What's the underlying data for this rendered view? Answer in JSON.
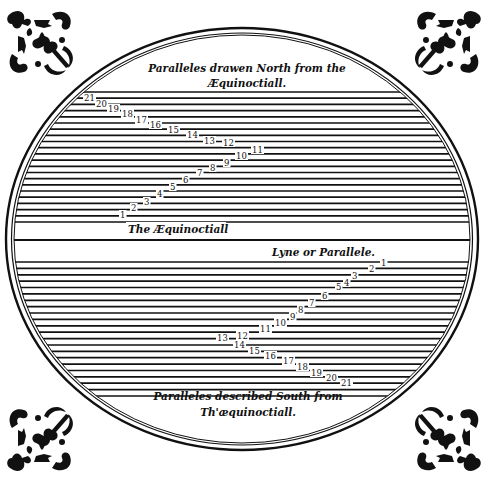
{
  "diagram": {
    "title_north": [
      "Paralleles drawen North from the",
      "Æquinoctiall."
    ],
    "title_south": [
      "Paralleles described South from",
      "Th'æquinoctiall."
    ],
    "equator_label": "The Æquinoctiall",
    "parallel_label": "Lyne or Parallele.",
    "ink_color": "#111111",
    "paper_color": "#ffffff",
    "ellipse": {
      "cx": 242,
      "cy": 239,
      "rx": 236,
      "ry": 211,
      "inner_offset": 5
    },
    "equator_y": 240,
    "north_parallels": {
      "top": 92,
      "bottom": 222,
      "count": 22
    },
    "south_parallels": {
      "top": 262,
      "bottom": 396,
      "count": 22
    },
    "north_numbers": [
      {
        "n": "1",
        "x": 120,
        "y": 218
      },
      {
        "n": "2",
        "x": 131,
        "y": 211
      },
      {
        "n": "3",
        "x": 144,
        "y": 205
      },
      {
        "n": "4",
        "x": 157,
        "y": 197
      },
      {
        "n": "5",
        "x": 170,
        "y": 190
      },
      {
        "n": "6",
        "x": 183,
        "y": 183
      },
      {
        "n": "7",
        "x": 197,
        "y": 176
      },
      {
        "n": "8",
        "x": 210,
        "y": 171
      },
      {
        "n": "9",
        "x": 224,
        "y": 166
      },
      {
        "n": "10",
        "x": 236,
        "y": 159
      },
      {
        "n": "11",
        "x": 252,
        "y": 153
      },
      {
        "n": "12",
        "x": 223,
        "y": 146
      },
      {
        "n": "13",
        "x": 204,
        "y": 144
      },
      {
        "n": "14",
        "x": 187,
        "y": 138
      },
      {
        "n": "15",
        "x": 168,
        "y": 133
      },
      {
        "n": "16",
        "x": 150,
        "y": 128
      },
      {
        "n": "17",
        "x": 136,
        "y": 123
      },
      {
        "n": "18",
        "x": 122,
        "y": 117
      },
      {
        "n": "19",
        "x": 108,
        "y": 112
      },
      {
        "n": "20",
        "x": 96,
        "y": 107
      },
      {
        "n": "21",
        "x": 84,
        "y": 101
      }
    ],
    "south_numbers": [
      {
        "n": "1",
        "x": 381,
        "y": 266
      },
      {
        "n": "2",
        "x": 369,
        "y": 272
      },
      {
        "n": "3",
        "x": 352,
        "y": 279
      },
      {
        "n": "4",
        "x": 344,
        "y": 286
      },
      {
        "n": "5",
        "x": 336,
        "y": 290
      },
      {
        "n": "6",
        "x": 322,
        "y": 299
      },
      {
        "n": "7",
        "x": 309,
        "y": 306
      },
      {
        "n": "8",
        "x": 298,
        "y": 313
      },
      {
        "n": "9",
        "x": 290,
        "y": 320
      },
      {
        "n": "10",
        "x": 275,
        "y": 326
      },
      {
        "n": "11",
        "x": 260,
        "y": 332
      },
      {
        "n": "12",
        "x": 237,
        "y": 339
      },
      {
        "n": "13",
        "x": 217,
        "y": 341
      },
      {
        "n": "14",
        "x": 234,
        "y": 348
      },
      {
        "n": "15",
        "x": 249,
        "y": 354
      },
      {
        "n": "16",
        "x": 265,
        "y": 359
      },
      {
        "n": "17",
        "x": 283,
        "y": 364
      },
      {
        "n": "18",
        "x": 297,
        "y": 370
      },
      {
        "n": "19",
        "x": 311,
        "y": 376
      },
      {
        "n": "20",
        "x": 326,
        "y": 381
      },
      {
        "n": "21",
        "x": 341,
        "y": 386
      }
    ],
    "ornaments": [
      "corner-ornament-top-left",
      "corner-ornament-top-right",
      "corner-ornament-bottom-left",
      "corner-ornament-bottom-right"
    ]
  }
}
